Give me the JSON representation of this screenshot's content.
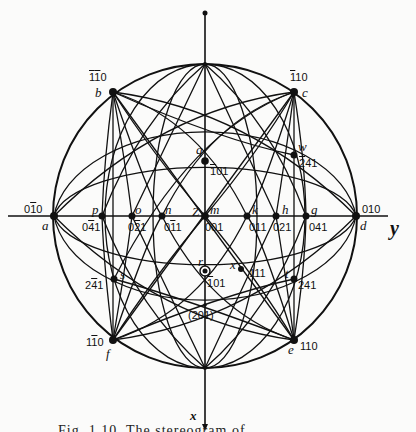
{
  "diagram": {
    "type": "stereographic-projection",
    "center": {
      "x": 205,
      "y": 216
    },
    "radius": 152,
    "axes": {
      "x_label": "x",
      "y_label": "y",
      "z_label": "z"
    },
    "poles": [
      {
        "letter": "a",
        "index": "0̅1̅0",
        "index_display": "01̅0",
        "x": 54,
        "y": 216
      },
      {
        "letter": "d",
        "index": "010",
        "x": 356,
        "y": 216
      },
      {
        "letter": "b",
        "index_display": "1̅1̅0",
        "x": 113,
        "y": 92
      },
      {
        "letter": "c",
        "index_display": "1̅10",
        "x": 294,
        "y": 92
      },
      {
        "letter": "f",
        "index_display": "11̅0",
        "x": 113,
        "y": 340
      },
      {
        "letter": "e",
        "index_display": "110",
        "x": 294,
        "y": 340
      },
      {
        "letter": "p",
        "index_display": "04̅1",
        "x": 102,
        "y": 216
      },
      {
        "letter": "o",
        "index_display": "02̅1",
        "x": 132,
        "y": 216
      },
      {
        "letter": "n",
        "index_display": "01̅1",
        "x": 162,
        "y": 216
      },
      {
        "letter": "m",
        "index_display": "001",
        "x": 205,
        "y": 216
      },
      {
        "letter": "k",
        "index_display": "011",
        "x": 247,
        "y": 216
      },
      {
        "letter": "h",
        "index_display": "021",
        "x": 276,
        "y": 216
      },
      {
        "letter": "g",
        "index_display": "041",
        "x": 306,
        "y": 216
      },
      {
        "letter": "q",
        "index_display": "1̅01",
        "x": 205,
        "y": 161
      },
      {
        "letter": "r",
        "index_display": "101",
        "x": 205,
        "y": 271
      },
      {
        "letter": "w",
        "index_display": "2̅41",
        "x": 294,
        "y": 155
      },
      {
        "letter": "s",
        "index_display": "24̅1",
        "x": 114,
        "y": 279
      },
      {
        "letter": "t",
        "index_display": "241",
        "x": 294,
        "y": 279
      },
      {
        "letter": "x",
        "index_display": "111",
        "x": 241,
        "y": 269
      }
    ],
    "extra_label": "(201)",
    "labels": {
      "b_index": "110",
      "c_index": "110",
      "a_index": "010",
      "d_index": "010",
      "f_index": "110",
      "e_index": "110",
      "p_index": "041",
      "o_index": "021",
      "n_index": "011",
      "m_index": "001",
      "k_index": "011",
      "h_index": "021",
      "g_index": "041",
      "q_index": "101",
      "r_index": "101",
      "w_index": "241",
      "s_index": "241",
      "t_index": "241",
      "x_index": "111",
      "p": "p",
      "o": "o",
      "n": "n",
      "m": "m",
      "k": "k",
      "h": "h",
      "g": "g",
      "a": "a",
      "d": "d",
      "b": "b",
      "c": "c",
      "f": "f",
      "e": "e",
      "q": "q",
      "r": "r",
      "w": "w",
      "s": "s",
      "t": "t",
      "x": "x",
      "z": "Z",
      "axis_x": "x",
      "axis_y": "y",
      "pole_201": "(201)"
    },
    "caption": "Fig. 1.10. The stereogram of..."
  }
}
